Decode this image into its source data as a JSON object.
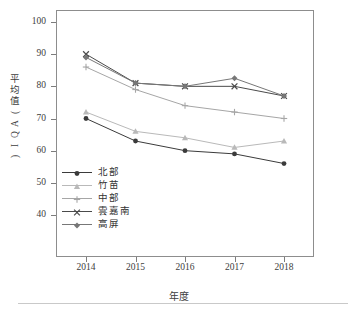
{
  "chart_data": {
    "type": "line",
    "title": "",
    "xlabel": "年度",
    "ylabel": "平均值(AQI)",
    "categories": [
      "2014",
      "2015",
      "2016",
      "2017",
      "2018"
    ],
    "x": [
      2014,
      2015,
      2016,
      2017,
      2018
    ],
    "ylim": [
      40,
      100
    ],
    "yticks": [
      40,
      50,
      60,
      70,
      80,
      90,
      100
    ],
    "grid": false,
    "legend_position": "inside-lower-left",
    "series": [
      {
        "name": "北部",
        "marker": "filled-circle",
        "color": "#3b3b3b",
        "values": [
          70,
          63,
          60,
          59,
          56
        ]
      },
      {
        "name": "竹苗",
        "marker": "filled-triangle",
        "color": "#b9b9b9",
        "values": [
          72,
          66,
          64,
          61,
          63
        ]
      },
      {
        "name": "中部",
        "marker": "plus",
        "color": "#a6a6a6",
        "values": [
          86,
          79,
          74,
          72,
          70
        ]
      },
      {
        "name": "雲嘉南",
        "marker": "x-cross",
        "color": "#4a4a4a",
        "values": [
          90,
          81,
          80,
          80,
          77
        ]
      },
      {
        "name": "高屏",
        "marker": "filled-diamond",
        "color": "#777777",
        "values": [
          89,
          81,
          80,
          82.5,
          77
        ]
      }
    ]
  },
  "axis": {
    "y_tick_labels": [
      "100",
      "90",
      "80",
      "70",
      "60",
      "50",
      "40"
    ],
    "x_tick_labels": [
      "2014",
      "2015",
      "2016",
      "2017",
      "2018"
    ],
    "y_title_chars": [
      "平",
      "均",
      "值",
      "(",
      "A",
      "Q",
      "I",
      ")"
    ],
    "y_title": "平均值(AQI)",
    "x_title": "年度"
  },
  "legend": {
    "items": [
      {
        "label": "北部",
        "marker": "filled-circle"
      },
      {
        "label": "竹苗",
        "marker": "filled-triangle"
      },
      {
        "label": "中部",
        "marker": "plus"
      },
      {
        "label": "雲嘉南",
        "marker": "x-cross"
      },
      {
        "label": "高屏",
        "marker": "filled-diamond"
      }
    ]
  },
  "colors": {
    "frame": "#8d8d8d",
    "text": "#3d3d3d",
    "background": "#ffffff",
    "rule": "#c9c9c9"
  }
}
